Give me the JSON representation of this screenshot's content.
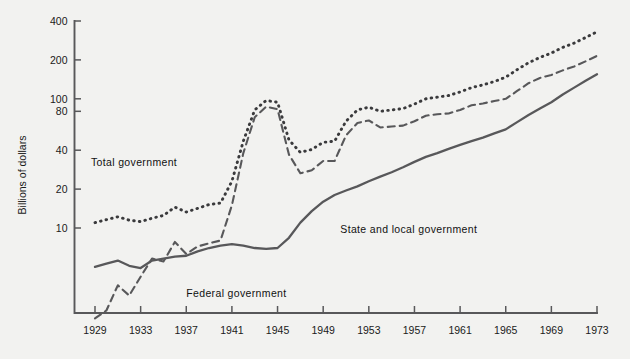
{
  "chart_data": {
    "type": "line",
    "title": "",
    "xlabel": "",
    "ylabel": "Billions of dollars",
    "yscale": "log",
    "ylim": [
      1.5,
      480
    ],
    "xlim": [
      1929,
      1973
    ],
    "grid": false,
    "legend_position": "inline-annotations",
    "y_ticks": [
      10,
      20,
      40,
      80,
      100,
      200,
      400
    ],
    "y_tick_labels": [
      "10",
      "20",
      "40",
      "80",
      "100",
      "200",
      "400"
    ],
    "x_ticks": [
      1929,
      1933,
      1937,
      1941,
      1945,
      1949,
      1953,
      1957,
      1961,
      1965,
      1969,
      1973
    ],
    "x_tick_labels": [
      "1929",
      "1933",
      "1937",
      "1941",
      "1945",
      "1949",
      "1953",
      "1957",
      "1961",
      "1965",
      "1969",
      "1973"
    ],
    "x": [
      1929,
      1930,
      1931,
      1932,
      1933,
      1934,
      1935,
      1936,
      1937,
      1938,
      1939,
      1940,
      1941,
      1942,
      1943,
      1944,
      1945,
      1946,
      1947,
      1948,
      1949,
      1950,
      1951,
      1952,
      1953,
      1954,
      1955,
      1956,
      1957,
      1958,
      1959,
      1960,
      1961,
      1962,
      1963,
      1964,
      1965,
      1966,
      1967,
      1968,
      1969,
      1970,
      1971,
      1972,
      1973
    ],
    "series": [
      {
        "name": "Total government",
        "style": "dotted",
        "color": "#3a3a3c",
        "label_x": 1936.2,
        "label_y": 30,
        "values": [
          11.0,
          11.6,
          12.2,
          11.5,
          11.2,
          11.9,
          12.5,
          14.5,
          13.3,
          14.2,
          15.2,
          15.6,
          23.0,
          47.0,
          82.0,
          97.0,
          94.0,
          48.0,
          38.5,
          40.5,
          46.0,
          47.0,
          67.0,
          82.0,
          86.0,
          80.0,
          82.0,
          84.0,
          91.0,
          100.0,
          103.0,
          106.0,
          113.0,
          122.0,
          128.0,
          136.0,
          147.0,
          168.0,
          190.0,
          209.0,
          226.0,
          250.0,
          270.0,
          298.0,
          330.0
        ]
      },
      {
        "name": "Federal government",
        "style": "dashed",
        "color": "#58585a",
        "label_x": 1937.0,
        "label_y": 2.9,
        "values": [
          2.0,
          2.3,
          3.6,
          3.0,
          4.2,
          5.8,
          5.5,
          7.8,
          6.3,
          7.2,
          7.6,
          8.0,
          15.0,
          38.0,
          72.0,
          87.0,
          83.0,
          37.0,
          26.5,
          28.0,
          33.0,
          33.0,
          52.0,
          65.0,
          68.0,
          60.0,
          61.0,
          62.0,
          67.0,
          74.0,
          76.0,
          77.0,
          82.0,
          89.0,
          92.0,
          96.0,
          100.0,
          115.0,
          132.0,
          145.0,
          153.0,
          166.0,
          178.0,
          195.0,
          215.0
        ]
      },
      {
        "name": "State and local government",
        "style": "solid",
        "color": "#58585a",
        "label_x": 1950.5,
        "label_y": 9.2,
        "values": [
          5.0,
          5.3,
          5.6,
          5.1,
          4.9,
          5.6,
          5.8,
          6.0,
          6.1,
          6.6,
          7.0,
          7.3,
          7.5,
          7.3,
          7.0,
          6.9,
          7.0,
          8.4,
          11.0,
          13.5,
          16.0,
          18.0,
          19.5,
          21.0,
          23.0,
          25.0,
          27.0,
          29.5,
          32.5,
          35.5,
          38.0,
          41.0,
          44.0,
          47.0,
          50.0,
          54.0,
          58.0,
          66.0,
          75.0,
          84.0,
          94.0,
          108.0,
          122.0,
          138.0,
          155.0
        ]
      }
    ]
  },
  "annotations": {
    "total": "Total government",
    "federal": "Federal government",
    "state_local": "State and local government"
  }
}
